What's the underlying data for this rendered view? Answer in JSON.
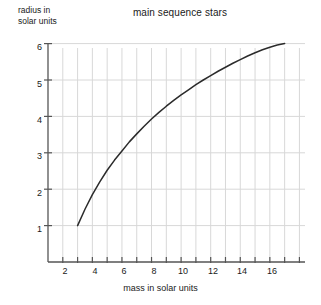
{
  "chart_data": {
    "type": "line",
    "title": "main sequence stars",
    "xlabel": "mass in solar units",
    "ylabel": "radius in solar units",
    "ylabel_lines": [
      "radius in",
      "solar units"
    ],
    "xlim": [
      0,
      18.4
    ],
    "ylim": [
      0,
      6.6
    ],
    "grid": true,
    "legend": "none",
    "x_major_ticks": [
      2,
      4,
      6,
      8,
      10,
      12,
      14,
      16
    ],
    "x_minor_ticks": [
      1,
      3,
      5,
      7,
      9,
      11,
      13,
      15,
      17,
      18
    ],
    "x_tick_labels": [
      "2",
      "4",
      "6",
      "8",
      "10",
      "12",
      "14",
      "16"
    ],
    "y_major_ticks": [
      1,
      2,
      3,
      4,
      5,
      6
    ],
    "y_tick_labels": [
      "1",
      "2",
      "3",
      "4",
      "5",
      "6"
    ],
    "series": [
      {
        "name": "radius vs mass",
        "color": "#2b2b2b",
        "x": [
          2,
          2.5,
          3,
          3.5,
          4,
          4.5,
          5,
          5.5,
          6,
          6.5,
          7,
          7.5,
          8,
          8.5,
          9,
          9.5,
          10,
          10.5,
          11,
          11.5,
          12,
          12.5,
          13,
          13.5,
          14,
          14.5,
          15,
          15.5,
          16
        ],
        "y": [
          1.0,
          1.45,
          1.85,
          2.2,
          2.52,
          2.8,
          3.05,
          3.3,
          3.52,
          3.73,
          3.93,
          4.11,
          4.28,
          4.44,
          4.59,
          4.73,
          4.87,
          5.0,
          5.12,
          5.24,
          5.35,
          5.46,
          5.56,
          5.66,
          5.75,
          5.83,
          5.9,
          5.96,
          6.0
        ]
      }
    ],
    "colors": {
      "curve": "#2b2b2b",
      "axis": "#555555",
      "grid": "#d8d8d8",
      "text": "#1a1a1a",
      "background": "#ffffff"
    }
  }
}
